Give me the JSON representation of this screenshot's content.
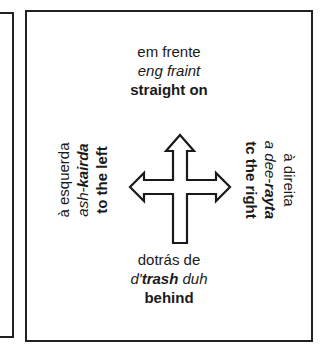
{
  "directions": {
    "forward": {
      "portuguese": "em frente",
      "pronunciation": "eng fraint",
      "english": "straight on"
    },
    "left": {
      "portuguese": "à esquerda",
      "pronunciation_prefix": "ash-",
      "pronunciation_stress": "kairda",
      "english": "to the left"
    },
    "right": {
      "portuguese": "à direita",
      "pronunciation_prefix": "a dee-",
      "pronunciation_stress": "rayta",
      "english": "tc the right"
    },
    "behind": {
      "portuguese": "dotrás de",
      "pronunciation_prefix": "d'",
      "pronunciation_stress": "trash",
      "pronunciation_suffix": " duh",
      "english": "behind"
    }
  },
  "icons": {
    "center": "four-way-arrow-icon"
  },
  "colors": {
    "ink": "#1a1a1a",
    "frame": "#222222",
    "background": "#ffffff"
  }
}
